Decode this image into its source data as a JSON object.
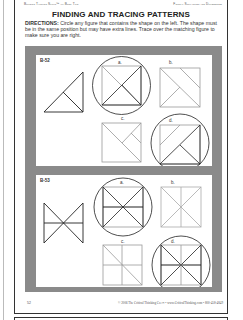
{
  "header": {
    "left": "Building Thinking Skills™ — Book Two",
    "right": "Figural Similarities and Differences"
  },
  "title": "FINDING AND TRACING PATTERNS",
  "directions": {
    "label": "DIRECTIONS:",
    "text": " Circle any figure that contains the shape on the left. The shape must be in the same position but may have extra lines. Trace over the matching figure to make sure you are right."
  },
  "problems": [
    {
      "id": "B-52",
      "options": [
        {
          "letter": "a.",
          "circled": true
        },
        {
          "letter": "b.",
          "circled": false
        },
        {
          "letter": "c.",
          "circled": false
        },
        {
          "letter": "d.",
          "circled": true
        }
      ]
    },
    {
      "id": "B-53",
      "options": [
        {
          "letter": "a.",
          "circled": true
        },
        {
          "letter": "b.",
          "circled": false
        },
        {
          "letter": "c.",
          "circled": false
        },
        {
          "letter": "d.",
          "circled": true
        }
      ]
    }
  ],
  "footer": {
    "page_number": "52",
    "copyright": "© 2006 The Critical Thinking Co.™ • www.CriticalThinking.com • 800-458-4849"
  },
  "colors": {
    "frame": "#8a8a8a",
    "ink": "#222222",
    "light_line": "#999999"
  }
}
